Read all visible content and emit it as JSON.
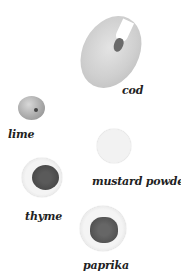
{
  "ingredients": [
    {
      "name": "cod",
      "label": "cod"
    },
    {
      "name": "lime",
      "label": "lime"
    },
    {
      "name": "mustard-powder",
      "label": "mustard powder"
    },
    {
      "name": "thyme",
      "label": "thyme"
    },
    {
      "name": "paprika",
      "label": "paprika"
    }
  ],
  "colors": {
    "background": "#ffffff",
    "label": "#222222"
  }
}
